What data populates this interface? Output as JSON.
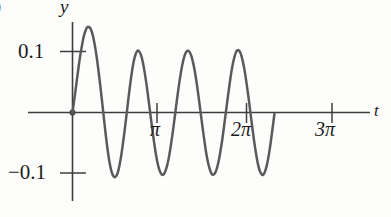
{
  "figure": {
    "panel_label": ")",
    "curve_color": "#5a5a5a",
    "axis_color": "#3d3d3d"
  },
  "chart_data": {
    "type": "line",
    "title": "",
    "subtitle": "",
    "xlabel": "t",
    "ylabel": "y",
    "grid": false,
    "legend": null,
    "annotations": [],
    "xlim": [
      -0.2,
      11.0
    ],
    "ylim": [
      -0.145,
      0.155
    ],
    "xticks": [
      3.14159,
      6.28319,
      9.42478
    ],
    "xtick_labels": [
      "π",
      "2π",
      "3π"
    ],
    "yticks": [
      0.1,
      -0.1
    ],
    "ytick_labels": [
      "0.1",
      "−0.1"
    ],
    "origin_marker": true,
    "series": [
      {
        "name": "y(t)",
        "description": "damped-start oscillation, period pi, first peak overshoots to about 0.14 then settles near amplitude 0.1",
        "x": [
          0.0,
          0.1,
          0.2,
          0.3,
          0.4,
          0.5,
          0.6,
          0.7,
          0.8,
          0.9,
          1.0,
          1.1,
          1.2,
          1.3,
          1.4,
          1.5,
          1.6,
          1.7,
          1.8,
          1.9,
          2.0,
          2.1,
          2.2,
          2.3,
          2.4,
          2.5,
          2.6,
          2.7,
          2.8,
          2.9,
          3.0,
          3.1,
          3.2,
          3.3,
          3.4,
          3.5,
          3.6,
          3.7,
          3.8,
          3.9,
          4.0,
          4.1,
          4.2,
          4.3,
          4.4,
          4.5,
          4.6,
          4.7,
          4.8,
          4.9,
          5.0,
          5.1,
          5.2,
          5.3,
          5.4,
          5.5,
          5.6,
          5.7,
          5.8,
          5.9,
          6.0,
          6.1,
          6.2,
          6.3,
          6.4,
          6.5,
          6.6,
          6.7,
          6.8,
          6.9,
          7.0,
          7.1,
          7.2,
          7.3,
          7.4,
          7.5,
          7.6,
          7.7,
          7.8,
          7.9,
          8.0,
          8.1,
          8.2,
          8.3,
          8.4,
          8.5,
          8.6,
          8.7,
          8.8,
          8.9,
          9.0,
          9.1,
          9.2,
          9.3,
          9.4,
          9.5,
          9.6,
          9.7,
          9.8,
          9.9,
          10.0,
          10.1,
          10.2,
          10.3,
          10.4,
          10.5,
          10.6,
          10.7,
          10.8,
          10.9
        ],
        "y": [
          0.0,
          0.022,
          0.045,
          0.068,
          0.09,
          0.108,
          0.124,
          0.134,
          0.14,
          0.14,
          0.136,
          0.126,
          0.111,
          0.092,
          0.069,
          0.044,
          0.017,
          -0.011,
          -0.038,
          -0.062,
          -0.082,
          -0.096,
          -0.104,
          -0.106,
          -0.102,
          -0.092,
          -0.076,
          -0.056,
          -0.033,
          -0.008,
          0.018,
          0.043,
          0.065,
          0.083,
          0.095,
          0.101,
          0.1,
          0.094,
          0.082,
          0.065,
          0.045,
          0.022,
          -0.002,
          -0.026,
          -0.048,
          -0.068,
          -0.084,
          -0.095,
          -0.101,
          -0.102,
          -0.097,
          -0.088,
          -0.074,
          -0.056,
          -0.035,
          -0.012,
          0.012,
          0.035,
          0.056,
          0.074,
          0.088,
          0.097,
          0.101,
          0.1,
          0.094,
          0.083,
          0.068,
          0.049,
          0.027,
          0.004,
          -0.02,
          -0.042,
          -0.063,
          -0.08,
          -0.092,
          -0.1,
          -0.102,
          -0.099,
          -0.091,
          -0.078,
          -0.061,
          -0.041,
          -0.018,
          0.005,
          0.029,
          0.051,
          0.071,
          0.086,
          0.097,
          0.102,
          0.101,
          0.095,
          0.083,
          0.067,
          0.047,
          0.025,
          0.001,
          -0.023,
          -0.046,
          -0.066,
          -0.083,
          -0.095,
          -0.101,
          -0.102,
          -0.096,
          -0.085,
          -0.069,
          -0.049,
          -0.026,
          -0.002
        ]
      }
    ],
    "peaks": {
      "t": [
        0.85,
        3.5,
        5.95,
        9.2,
        12.1
      ],
      "note": "first peak ~0.14, remaining peaks ~0.10"
    },
    "troughs": {
      "note": "all troughs ~ -0.10"
    }
  }
}
